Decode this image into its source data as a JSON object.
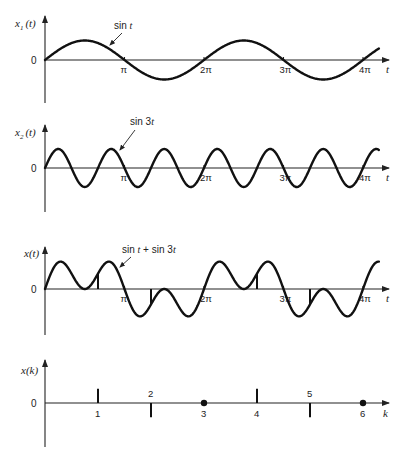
{
  "chart_data": [
    {
      "type": "line",
      "ylabel": "x1(t)",
      "ylabel_main": "x",
      "ylabel_sub": "1",
      "ylabel_tail": "(t)",
      "xlabel": "t",
      "zero_label": "0",
      "function": "sin t",
      "annotation": "sin t",
      "x_range": [
        0,
        4.2
      ],
      "x_unit": "pi",
      "xticks": [
        1,
        2,
        3,
        4
      ],
      "xtick_labels": [
        "π",
        "2π",
        "3π",
        "4π"
      ],
      "harmonics": [
        1
      ],
      "ylim": [
        -2.3,
        2.3
      ]
    },
    {
      "type": "line",
      "ylabel": "x2(t)",
      "ylabel_main": "x",
      "ylabel_sub": "2",
      "ylabel_tail": "(t)",
      "xlabel": "t",
      "zero_label": "0",
      "function": "sin 3t",
      "annotation": "sin 3t",
      "x_range": [
        0,
        4.2
      ],
      "x_unit": "pi",
      "xticks": [
        1,
        2,
        3,
        4
      ],
      "xtick_labels": [
        "π",
        "2π",
        "3π",
        "4π"
      ],
      "harmonics": [
        3
      ],
      "ylim": [
        -2.3,
        2.3
      ]
    },
    {
      "type": "line",
      "ylabel": "x(t)",
      "ylabel_main": "x",
      "ylabel_sub": "",
      "ylabel_tail": "(t)",
      "xlabel": "t",
      "zero_label": "0",
      "function": "sin t + sin 3t",
      "annotation": "sin t + sin 3t",
      "x_range": [
        0,
        4.2
      ],
      "x_unit": "pi",
      "xticks": [
        1,
        2,
        3,
        4
      ],
      "xtick_labels": [
        "π",
        "2π",
        "3π",
        "4π"
      ],
      "harmonics": [
        1,
        3
      ],
      "sample_interval_pi": 0.6667,
      "sample_times_pi": [
        0.6667,
        1.3333,
        2,
        2.6667,
        3.3333,
        4
      ],
      "ylim": [
        -2.3,
        2.3
      ]
    },
    {
      "type": "scatter",
      "subtype": "stem",
      "ylabel": "x(k)",
      "ylabel_main": "x",
      "ylabel_sub": "",
      "ylabel_tail": "(k)",
      "xlabel": "k",
      "zero_label": "0",
      "x": [
        1,
        2,
        3,
        4,
        5,
        6
      ],
      "x_labels": [
        "1",
        "2",
        "3",
        "4",
        "5",
        "6"
      ],
      "values": [
        0.866,
        -0.866,
        0,
        0.866,
        -0.866,
        0
      ],
      "x_range": [
        0,
        6.5
      ],
      "ylim": [
        -2.3,
        2.3
      ]
    }
  ]
}
